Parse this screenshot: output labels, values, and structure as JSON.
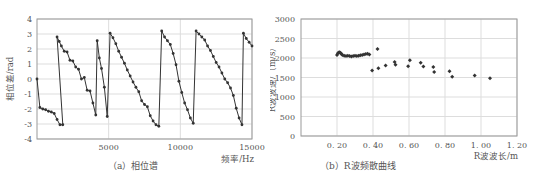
{
  "chart_data": [
    {
      "type": "line",
      "panel_caption": "（a）相位谱",
      "title": "",
      "xlabel": "频率/Hz",
      "ylabel": "相位差/rad",
      "xlim": [
        0,
        15000
      ],
      "ylim": [
        -4,
        4
      ],
      "xticks": [
        5000,
        10000,
        15000
      ],
      "yticks": [
        4,
        3,
        2,
        1,
        0,
        -1,
        -2,
        -3,
        -4
      ],
      "grid": true,
      "markers": true,
      "series": [
        {
          "name": "phase",
          "x": [
            0,
            200,
            400,
            600,
            800,
            1000,
            1200,
            1400,
            1600,
            1800,
            1400,
            1550,
            1700,
            1900,
            2100,
            2300,
            2500,
            2700,
            2900,
            3100,
            3300,
            3500,
            3700,
            3900,
            4100,
            4200,
            4350,
            4500,
            4700,
            4900,
            5100,
            5300,
            5500,
            5700,
            5900,
            6100,
            6300,
            6500,
            6700,
            6900,
            7100,
            7300,
            7500,
            7700,
            7900,
            8100,
            8300,
            8500,
            8700,
            8900,
            9100,
            9300,
            9500,
            9700,
            9900,
            10100,
            10300,
            10500,
            10700,
            10900,
            11100,
            11300,
            11500,
            11700,
            11900,
            12100,
            12300,
            12500,
            12700,
            12900,
            13100,
            13300,
            13500,
            13700,
            13900,
            14100,
            14300,
            14400,
            14600,
            14800,
            15000
          ],
          "y": [
            0.0,
            -1.9,
            -2.0,
            -2.05,
            -2.15,
            -2.2,
            -2.3,
            -2.7,
            -3.05,
            -3.05,
            2.8,
            2.5,
            2.2,
            1.85,
            1.8,
            1.25,
            1.2,
            0.8,
            0.65,
            0.0,
            0.1,
            -0.75,
            -0.8,
            -1.6,
            -2.4,
            2.55,
            1.4,
            0.7,
            -0.55,
            -2.5,
            3.05,
            2.75,
            2.35,
            1.85,
            1.45,
            1.05,
            0.6,
            0.2,
            -0.2,
            -0.55,
            -0.85,
            -1.45,
            -1.7,
            -1.85,
            -2.45,
            -2.8,
            -3.05,
            -3.15,
            3.2,
            2.8,
            2.55,
            2.3,
            1.7,
            0.95,
            -0.15,
            -0.9,
            -1.6,
            -2.05,
            -2.6,
            -2.95,
            3.2,
            3.0,
            2.8,
            2.6,
            2.2,
            1.9,
            1.5,
            1.1,
            0.8,
            0.4,
            0.0,
            -0.25,
            -0.6,
            -1.1,
            -1.95,
            -2.6,
            -3.05,
            3.05,
            2.7,
            2.45,
            2.2
          ]
        }
      ]
    },
    {
      "type": "scatter",
      "panel_caption": "（b）R波频散曲线",
      "title": "",
      "xlabel": "R波波长/m",
      "ylabel": "R波波速/（m/s）",
      "xlim": [
        0,
        1.2
      ],
      "ylim": [
        0,
        3000
      ],
      "xticks": [
        "0.20",
        "0.40",
        "0.60",
        "0.80",
        "1.00",
        "1.20"
      ],
      "yticks": [
        3000,
        2500,
        2000,
        1500,
        1000,
        500,
        0
      ],
      "grid": true,
      "series": [
        {
          "name": "dispersion",
          "x": [
            0.2,
            0.205,
            0.21,
            0.215,
            0.22,
            0.225,
            0.23,
            0.24,
            0.25,
            0.26,
            0.27,
            0.28,
            0.29,
            0.3,
            0.31,
            0.32,
            0.33,
            0.34,
            0.35,
            0.36,
            0.37,
            0.38,
            0.395,
            0.425,
            0.43,
            0.47,
            0.52,
            0.525,
            0.595,
            0.605,
            0.665,
            0.68,
            0.735,
            0.74,
            0.825,
            0.84,
            0.965,
            1.05
          ],
          "y": [
            2080,
            2120,
            2140,
            2150,
            2130,
            2100,
            2080,
            2060,
            2050,
            2060,
            2050,
            2040,
            2050,
            2060,
            2050,
            2060,
            2070,
            2080,
            2090,
            2100,
            2110,
            2090,
            1680,
            2230,
            1740,
            1810,
            1900,
            1830,
            1790,
            1940,
            1880,
            1780,
            1770,
            1640,
            1660,
            1520,
            1550,
            1480
          ]
        }
      ]
    }
  ],
  "labels": {
    "a_caption": "（a）相位谱",
    "a_xlabel": "频率/Hz",
    "a_ylabel": "相位差/rad",
    "b_caption": "（b）R波频散曲线",
    "b_xlabel": "R波波长/m",
    "b_ylabel": "R波波速/（m/s）"
  },
  "colors": {
    "line": "#333333",
    "marker": "#333333",
    "grid": "#dddddd",
    "axis": "#999999"
  }
}
